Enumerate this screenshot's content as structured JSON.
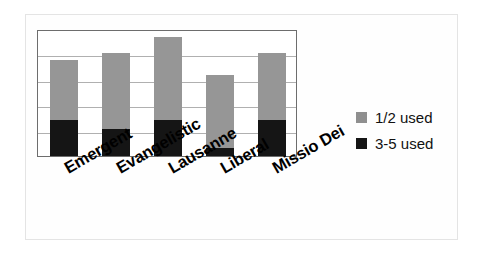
{
  "chart_data": {
    "type": "bar",
    "subtype": "stacked-bar",
    "title": "",
    "xlabel": "",
    "ylabel": "",
    "categories": [
      "Emergent",
      "Evangelistic",
      "Lausanne",
      "Liberal",
      "Missio Dei"
    ],
    "series": [
      {
        "name": "3-5 used",
        "color": "#151515",
        "values": [
          1.4,
          1.05,
          1.4,
          0.3,
          1.4
        ]
      },
      {
        "name": "1/2 used",
        "color": "#969696",
        "values": [
          2.4,
          3.0,
          3.3,
          2.9,
          2.65
        ]
      }
    ],
    "totals": [
      3.8,
      4.05,
      4.7,
      3.2,
      4.05
    ],
    "ylim": [
      0,
      5
    ],
    "yticks": [
      0,
      1,
      2,
      3,
      4,
      5
    ],
    "ytick_labels": [],
    "grid": true,
    "grid_axis": "y",
    "legend_position": "right",
    "legend": [
      {
        "label": "1/2 used",
        "swatch": "gray"
      },
      {
        "label": "3-5 used",
        "swatch": "black"
      }
    ],
    "x_tick_label_rotation": -30,
    "plot_border_color": "#6d6d6d",
    "gridline_color": "#b0b0b0",
    "background_color": "#ffffff"
  }
}
